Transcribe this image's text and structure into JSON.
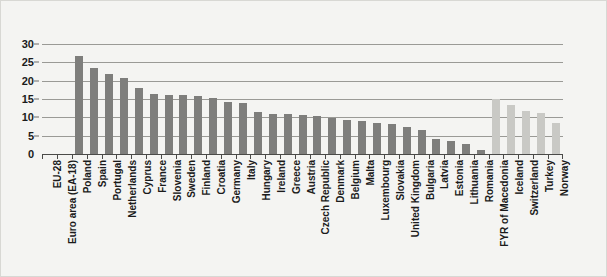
{
  "chart_data": {
    "type": "bar",
    "title": "",
    "subtitle": "",
    "xlabel": "",
    "ylabel": "",
    "ylim": [
      0,
      30
    ],
    "ytick_values": [
      0,
      5,
      10,
      15,
      20,
      25,
      30
    ],
    "ytick_labels": [
      "0",
      "5",
      "10",
      "15",
      "20",
      "25",
      "30"
    ],
    "grid": true,
    "legend": "none",
    "colors": {
      "eu_member_bar": "#7e7e7c",
      "non_eu_bar": "#c9c9c5",
      "gridline": "#9a9a96",
      "axis": "#4a4a48",
      "background": "#f4f4f2",
      "text": "#1b1b1b"
    },
    "categories": [
      "EU-28",
      "Euro area (EA-18)",
      "Poland",
      "Spain",
      "Portugal",
      "Netherlands",
      "Cyprus",
      "France",
      "Slovenia",
      "Sweden",
      "Finland",
      "Croatia",
      "Germany",
      "Italy",
      "Hungary",
      "Ireland",
      "Greece",
      "Austria",
      "Czech Republic",
      "Denmark",
      "Belgium",
      "Malta",
      "Luxembourg",
      "Slovakia",
      "United Kingdom",
      "Bulgaria",
      "Latvia",
      "Estonia",
      "Lithuania",
      "Romania",
      "FYR of Macedonia",
      "Iceland",
      "Switzerland",
      "Turkey",
      "Norway"
    ],
    "values": [
      null,
      null,
      26.7,
      23.5,
      21.8,
      20.6,
      17.9,
      16.3,
      16.2,
      16.0,
      15.8,
      15.3,
      14.2,
      13.8,
      11.5,
      11.0,
      10.9,
      10.6,
      10.5,
      9.7,
      9.3,
      8.9,
      8.5,
      8.3,
      7.3,
      6.6,
      4.0,
      3.6,
      2.6,
      1.2,
      14.9,
      13.3,
      11.8,
      11.1,
      8.4
    ],
    "series_groups": [
      {
        "name": "EU aggregates and Member States",
        "color": "#7e7e7c",
        "category_range": [
          0,
          29
        ]
      },
      {
        "name": "Non-EU countries",
        "color": "#c9c9c5",
        "category_range": [
          30,
          34
        ]
      }
    ]
  }
}
